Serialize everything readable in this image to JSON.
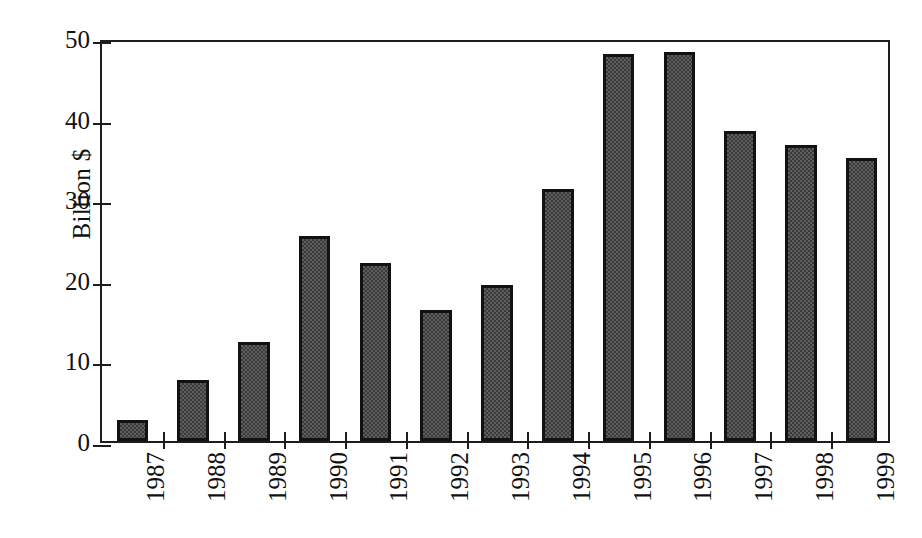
{
  "chart_data": {
    "type": "bar",
    "title": "",
    "subtitle": "",
    "xlabel": "",
    "ylabel": "Billion $",
    "categories": [
      "1987",
      "1988",
      "1989",
      "1990",
      "1991",
      "1992",
      "1993",
      "1994",
      "1995",
      "1996",
      "1997",
      "1998",
      "1999"
    ],
    "values": [
      2.6,
      7.6,
      12.3,
      25.4,
      22.1,
      16.3,
      19.3,
      31.3,
      48.0,
      48.3,
      38.5,
      36.7,
      35.1
    ],
    "series": [
      {
        "name": "Billion $",
        "values": [
          2.6,
          7.6,
          12.3,
          25.4,
          22.1,
          16.3,
          19.3,
          31.3,
          48.0,
          48.3,
          38.5,
          36.7,
          35.1
        ]
      }
    ],
    "ylim": [
      0,
      50
    ],
    "ytick_values": [
      0,
      10,
      20,
      30,
      40,
      50
    ],
    "ytick_labels": [
      "0",
      "10",
      "20",
      "30",
      "40",
      "50"
    ],
    "grid": false,
    "legend": false,
    "legend_position": "none",
    "annotations": [],
    "bar_fill_color": "#5e5e5e",
    "bar_border_color": "#121212",
    "axis_color": "#1d1d1d",
    "background_color": "#ffffff"
  }
}
